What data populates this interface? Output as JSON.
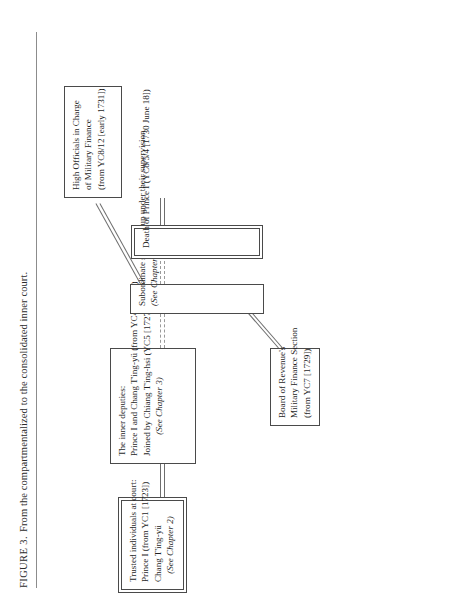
{
  "figure": {
    "caption_label": "FIGURE 3.",
    "caption_text": "From the compartmentalized to the consolidated inner court."
  },
  "nodes": {
    "trusted_individuals": {
      "lines": [
        "Trusted individuals at court:",
        "Prince I (from YC1 [1723])",
        "Chang T'ing-yü"
      ],
      "note": "(See Chapter 2)"
    },
    "inner_deputies": {
      "lines": [
        "The inner deputies:",
        "Prince I and Chang T'ing-yü (from YC4 [1726])",
        "Joined by Chiang T'ing-hsi (YC5 [1727])"
      ],
      "note": "(See Chapter 3)"
    },
    "subordinate_staffs": {
      "lines": [
        "Subordinate staffs set up under their supervision"
      ],
      "note": "(See Chapter 4)"
    },
    "board_of_revenue": {
      "lines": [
        "Board of Revenue's",
        "Military Finance Section",
        "(from YC7 [1729])"
      ]
    },
    "death_of_prince": {
      "lines": [
        "Death of Prince I (YC8/5/4 [1730 June 18])"
      ]
    },
    "high_officials": {
      "lines": [
        "High Officials in Charge",
        "of Military Finance",
        "(from YC8/12 [early 1731])"
      ]
    }
  },
  "colors": {
    "ink": "#1f1f1f",
    "rule": "#8c8c8c",
    "box_border": "#4a4a4a",
    "connector": "#6e6e6e",
    "page": "#ffffff"
  }
}
